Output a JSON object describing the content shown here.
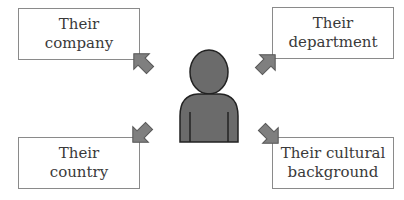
{
  "diagram": {
    "center": {
      "label": "person-figure",
      "fill": "#6b6b6b",
      "stroke": "#222222"
    },
    "boxes": [
      {
        "id": "company",
        "lines": [
          "Their",
          "company"
        ],
        "position": "top-left"
      },
      {
        "id": "department",
        "lines": [
          "Their",
          "department"
        ],
        "position": "top-right"
      },
      {
        "id": "country",
        "lines": [
          "Their",
          "country"
        ],
        "position": "bottom-left"
      },
      {
        "id": "culture",
        "lines": [
          "Their cultural",
          "background"
        ],
        "position": "bottom-right"
      }
    ],
    "arrow_color": "#7f7f7f",
    "arrow_stroke": "#555555",
    "box_border": "#8a8a8a"
  }
}
